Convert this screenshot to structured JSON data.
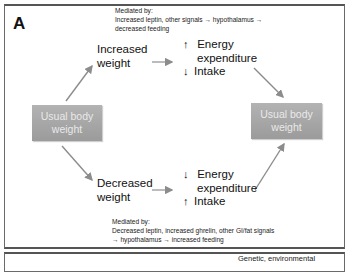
{
  "panel_a": {
    "label": "A",
    "top_mediation": {
      "line1": "Mediated by:",
      "line2": "Increased leptin, other signals → hypothalamus →",
      "line3": "decreased feeding"
    },
    "increased_weight": {
      "line1": "Increased",
      "line2": "weight"
    },
    "upper_effects": {
      "energy_arrow": "↑",
      "energy_line1": "Energy",
      "energy_line2": "expenditure",
      "intake_arrow": "↓",
      "intake_label": "Intake"
    },
    "left_box": {
      "line1": "Usual body",
      "line2": "weight"
    },
    "right_box": {
      "line1": "Usual body",
      "line2": "weight"
    },
    "decreased_weight": {
      "line1": "Decreased",
      "line2": "weight"
    },
    "lower_effects": {
      "energy_arrow": "↓",
      "energy_line1": "Energy",
      "energy_line2": "expenditure",
      "intake_arrow": "↑",
      "intake_label": "Intake"
    },
    "bottom_mediation": {
      "line1": "Mediated by:",
      "line2": "Decreased leptin, increased ghrelin, other GI/fat signals",
      "line3": "→ hypothalamus → increased feeding"
    },
    "colors": {
      "box_fill": "#a8a8a8",
      "box_text": "#e9e9e9",
      "arrow": "#8c8c8c",
      "border": "#6a6a6a"
    }
  },
  "panel_b": {
    "partial_text": "Genetic, environmental"
  }
}
